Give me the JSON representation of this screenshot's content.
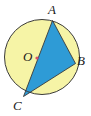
{
  "figure": {
    "type": "circle-inscribed-triangle",
    "width": 91,
    "height": 116,
    "background_color": "#ffffff",
    "colors": {
      "circle_fill_yellow": "#f6f4a6",
      "triangle_fill_blue": "#2e9bd6",
      "outline": "#3a3a3a",
      "center_dot": "#d6506a",
      "label_color": "#1a1a1a"
    },
    "circle": {
      "center_x": 42,
      "center_y": 57,
      "radius": 37.5,
      "stroke_width": 1
    },
    "center_point": {
      "label": "O",
      "x": 37,
      "y": 58,
      "dot_radius": 1.6
    },
    "points": [
      {
        "label": "A",
        "x": 52.5,
        "y": 20.5,
        "label_x": 48,
        "label_y": 3
      },
      {
        "label": "B",
        "x": 75.5,
        "y": 63.5,
        "label_x": 77,
        "label_y": 54
      },
      {
        "label": "C",
        "x": 23.5,
        "y": 96.5,
        "label_x": 13,
        "label_y": 99
      }
    ],
    "triangle_vertices": "52.5,20.5 75.5,63.5 23.5,96.5",
    "segments": [
      {
        "name": "AC",
        "from": "A",
        "to": "C"
      },
      {
        "name": "CB",
        "from": "C",
        "to": "B"
      },
      {
        "name": "BA",
        "from": "B",
        "to": "A"
      }
    ]
  }
}
